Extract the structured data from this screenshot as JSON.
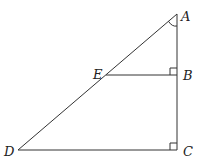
{
  "diagram": {
    "points": {
      "A": {
        "label": "A",
        "x": 177,
        "y": 14
      },
      "B": {
        "label": "B",
        "x": 177,
        "y": 75
      },
      "C": {
        "label": "C",
        "x": 177,
        "y": 150
      },
      "D": {
        "label": "D",
        "x": 18,
        "y": 150
      },
      "E": {
        "label": "E",
        "x": 106,
        "y": 75
      }
    },
    "segments": [
      "AD",
      "AC",
      "DC",
      "EB"
    ],
    "right_angles": [
      "B",
      "C"
    ],
    "angle_marks": [
      "A"
    ]
  }
}
